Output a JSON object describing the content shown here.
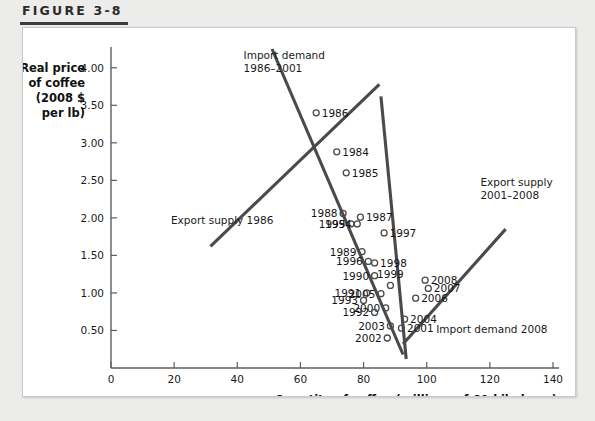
{
  "figure": {
    "label": "FIGURE 3-8"
  },
  "chart_data": {
    "type": "scatter",
    "title": "",
    "xlabel": "Quantity of coffee (millions of 60-kilo bags)",
    "ylabel": "Real price of coffee (2008 $ per lb)",
    "ylabel_lines": [
      "Real price",
      "of coffee",
      "(2008 $",
      "per lb)"
    ],
    "xlim": [
      0,
      140
    ],
    "ylim": [
      0,
      4.25
    ],
    "xticks": [
      0,
      20,
      40,
      60,
      80,
      100,
      120,
      140
    ],
    "xtick_labels": [
      "0",
      "20",
      "40",
      "60",
      "80",
      "100",
      "120",
      "140"
    ],
    "yticks": [
      0.5,
      1.0,
      1.5,
      2.0,
      2.5,
      3.0,
      3.5,
      4.0
    ],
    "ytick_labels": [
      "0.50",
      "1.00",
      "1.50",
      "2.00",
      "2.50",
      "3.00",
      "3.50",
      "4.00"
    ],
    "grid": false,
    "legend_position": "none",
    "marker_color": "#4a4a4a",
    "line_color": "#4a4a4a",
    "points": [
      {
        "label": "1986",
        "x": 65.0,
        "y": 3.4,
        "label_side": "right"
      },
      {
        "label": "1984",
        "x": 71.5,
        "y": 2.88,
        "label_side": "right"
      },
      {
        "label": "1985",
        "x": 74.5,
        "y": 2.6,
        "label_side": "right"
      },
      {
        "label": "1988",
        "x": 73.5,
        "y": 2.06,
        "label_side": "left"
      },
      {
        "label": "1987",
        "x": 79.0,
        "y": 2.01,
        "label_side": "right"
      },
      {
        "label": "1995",
        "x": 76.0,
        "y": 1.92,
        "label_side": "left"
      },
      {
        "label": "1994",
        "x": 78.0,
        "y": 1.92,
        "label_side": "left"
      },
      {
        "label": "1997",
        "x": 86.5,
        "y": 1.8,
        "label_side": "right"
      },
      {
        "label": "1989",
        "x": 79.5,
        "y": 1.55,
        "label_side": "left"
      },
      {
        "label": "1996",
        "x": 81.5,
        "y": 1.42,
        "label_side": "left"
      },
      {
        "label": "1998",
        "x": 83.5,
        "y": 1.4,
        "label_side": "right"
      },
      {
        "label": "1990",
        "x": 83.5,
        "y": 1.23,
        "label_side": "left"
      },
      {
        "label": "1999",
        "x": 88.5,
        "y": 1.1,
        "label_side": "above"
      },
      {
        "label": "2008",
        "x": 99.5,
        "y": 1.17,
        "label_side": "right"
      },
      {
        "label": "2007",
        "x": 100.5,
        "y": 1.06,
        "label_side": "right"
      },
      {
        "label": "1991",
        "x": 81.0,
        "y": 1.0,
        "label_side": "left"
      },
      {
        "label": "2005",
        "x": 85.5,
        "y": 0.99,
        "label_side": "left"
      },
      {
        "label": "1993",
        "x": 80.0,
        "y": 0.9,
        "label_side": "left"
      },
      {
        "label": "2006",
        "x": 96.5,
        "y": 0.93,
        "label_side": "right"
      },
      {
        "label": "2000",
        "x": 87.0,
        "y": 0.8,
        "label_side": "left"
      },
      {
        "label": "1992",
        "x": 83.5,
        "y": 0.74,
        "label_side": "left"
      },
      {
        "label": "2004",
        "x": 93.0,
        "y": 0.65,
        "label_side": "right"
      },
      {
        "label": "2003",
        "x": 88.5,
        "y": 0.56,
        "label_side": "left"
      },
      {
        "label": "2001",
        "x": 92.0,
        "y": 0.53,
        "label_side": "right"
      },
      {
        "label": "2002",
        "x": 87.5,
        "y": 0.4,
        "label_side": "left"
      }
    ],
    "lines": [
      {
        "name": "import-demand-1986-2001",
        "x1": 51.0,
        "y1": 4.25,
        "x2": 92.5,
        "y2": 0.18
      },
      {
        "name": "export-supply-1986",
        "x1": 31.5,
        "y1": 1.62,
        "x2": 85.0,
        "y2": 3.78
      },
      {
        "name": "import-demand-2008",
        "x1": 85.5,
        "y1": 3.62,
        "x2": 93.5,
        "y2": 0.12
      },
      {
        "name": "export-supply-2001-2008",
        "x1": 92.5,
        "y1": 0.32,
        "x2": 125.0,
        "y2": 1.85
      }
    ],
    "annotations": [
      {
        "name": "import-demand-1986-2001-label",
        "lines": [
          "Import demand",
          "1986–2001"
        ],
        "x": 42.0,
        "y": 4.12,
        "align": "start"
      },
      {
        "name": "export-supply-1986-label",
        "lines": [
          "Export supply 1986"
        ],
        "x": 19.0,
        "y": 1.92,
        "align": "start"
      },
      {
        "name": "export-supply-2001-2008-label",
        "lines": [
          "Export supply",
          "2001–2008"
        ],
        "x": 117.0,
        "y": 2.42,
        "align": "start"
      },
      {
        "name": "import-demand-2008-label",
        "lines": [
          "Import demand 2008"
        ],
        "x": 103.0,
        "y": 0.46,
        "align": "start"
      }
    ]
  }
}
